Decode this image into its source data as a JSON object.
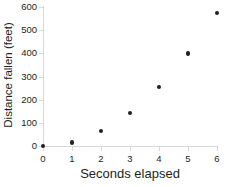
{
  "chart_data": {
    "type": "scatter",
    "title": "",
    "xlabel": "Seconds elapsed",
    "ylabel": "Distance fallen (feet)",
    "x": [
      0,
      1,
      2,
      3,
      4,
      5,
      6
    ],
    "values": [
      0,
      16,
      64,
      143,
      255,
      400,
      574
    ],
    "series": [
      {
        "name": "Distance fallen",
        "points": [
          {
            "x": 0,
            "y": 0
          },
          {
            "x": 1,
            "y": 16
          },
          {
            "x": 2,
            "y": 64
          },
          {
            "x": 3,
            "y": 143
          },
          {
            "x": 4,
            "y": 255
          },
          {
            "x": 5,
            "y": 400
          },
          {
            "x": 6,
            "y": 574
          }
        ]
      }
    ],
    "xlim": [
      0,
      6
    ],
    "ylim": [
      0,
      600
    ],
    "xticks": [
      "0",
      "1",
      "2",
      "3",
      "4",
      "5",
      "6"
    ],
    "yticks": [
      "0",
      "100",
      "200",
      "300",
      "400",
      "500",
      "600"
    ],
    "xtick_values": [
      0,
      1,
      2,
      3,
      4,
      5,
      6
    ],
    "ytick_values": [
      0,
      100,
      200,
      300,
      400,
      500,
      600
    ],
    "grid": false,
    "legend": null,
    "marker_color": "#231f20",
    "axis_color": "#d8d8d8",
    "background_color": "#ffffff"
  }
}
